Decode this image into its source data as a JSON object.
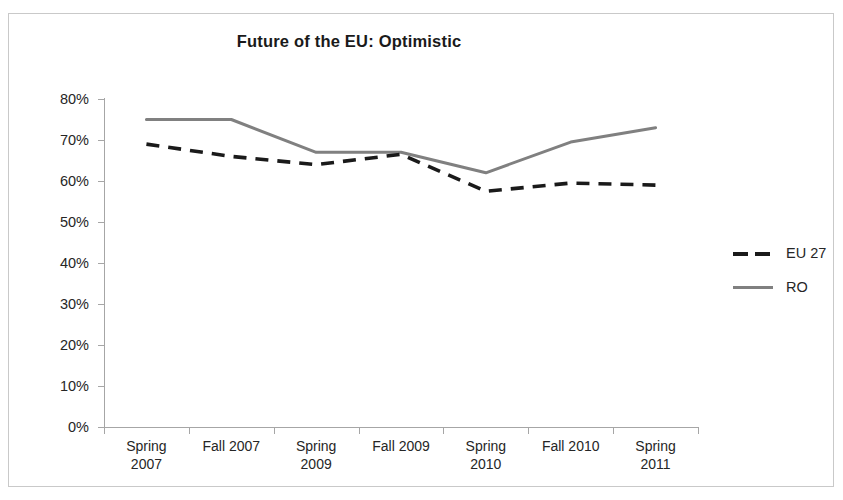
{
  "chart_data": {
    "type": "line",
    "title": "Future of the EU: Optimistic",
    "xlabel": "",
    "ylabel": "",
    "categories": [
      "Spring 2007",
      "Fall 2007",
      "Spring 2009",
      "Fall 2009",
      "Spring 2010",
      "Fall 2010",
      "Spring 2011"
    ],
    "category_lines": [
      [
        "Spring",
        "2007"
      ],
      [
        "Fall 2007",
        ""
      ],
      [
        "Spring",
        "2009"
      ],
      [
        "Fall 2009",
        ""
      ],
      [
        "Spring",
        "2010"
      ],
      [
        "Fall 2010",
        ""
      ],
      [
        "Spring",
        "2011"
      ]
    ],
    "series": [
      {
        "name": "EU 27",
        "values": [
          69,
          66,
          64,
          66.5,
          57.5,
          59.5,
          59
        ],
        "style": "dashed",
        "color": "#1a1a1a"
      },
      {
        "name": "RO",
        "values": [
          75,
          75,
          67,
          67,
          62,
          69.5,
          73
        ],
        "style": "solid",
        "color": "#808080"
      }
    ],
    "ylim": [
      0,
      80
    ],
    "ytick_values": [
      0,
      10,
      20,
      30,
      40,
      50,
      60,
      70,
      80
    ],
    "ytick_labels": [
      "0%",
      "10%",
      "20%",
      "30%",
      "40%",
      "50%",
      "60%",
      "70%",
      "80%"
    ],
    "grid": false,
    "legend_position": "right",
    "legend_entries": [
      "EU 27",
      "RO"
    ]
  },
  "frame": {
    "border_color": "#c9c9c9"
  },
  "axis": {
    "line_color": "#a6a6a6"
  }
}
